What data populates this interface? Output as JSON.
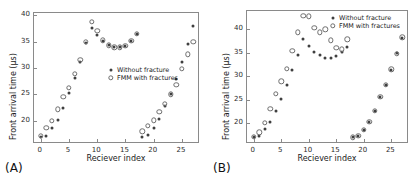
{
  "figure": {
    "background": "#ffffff",
    "marker_closed_color": "#3f3f3f",
    "marker_open_color": "#6d6d6d",
    "axis_color": "#8a8a8a"
  },
  "panels": [
    {
      "label": "(A)",
      "name": "panel-a",
      "chart_data": {
        "type": "scatter",
        "title": "",
        "xlabel": "Reciever index",
        "ylabel": "Front arrival time (μs)",
        "xlim": [
          -1.2,
          28.2
        ],
        "ylim": [
          15.6,
          40.4
        ],
        "xticks": [
          0,
          5,
          10,
          15,
          20,
          25
        ],
        "yticks": [
          20,
          25,
          30,
          35,
          40
        ],
        "grid": false,
        "legend_position": "center",
        "x": [
          0,
          1,
          2,
          3,
          4,
          5,
          6,
          7,
          8,
          9,
          10,
          11,
          12,
          13,
          14,
          15,
          16,
          17,
          18,
          19,
          20,
          21,
          22,
          23,
          24,
          25,
          26,
          27
        ],
        "series": [
          {
            "name": "Without fracture",
            "marker": "closed",
            "values": [
              17.0,
              17.2,
              18.6,
              20.2,
              22.4,
              25.3,
              28.1,
              31.2,
              34.8,
              37.6,
              36.3,
              35.1,
              34.3,
              33.9,
              33.9,
              34.2,
              35.1,
              36.4,
              17.0,
              17.3,
              18.7,
              20.3,
              22.7,
              25.0,
              28.0,
              31.1,
              34.6,
              37.9
            ]
          },
          {
            "name": "FMM with fractures",
            "marker": "open",
            "values": [
              17.1,
              18.7,
              20.0,
              22.2,
              24.5,
              26.2,
              28.9,
              31.5,
              35.0,
              38.7,
              37.0,
              35.2,
              34.3,
              33.9,
              33.9,
              34.2,
              35.1,
              36.5,
              18.0,
              19.0,
              20.1,
              21.7,
              23.2,
              25.0,
              26.8,
              29.8,
              32.6,
              34.9
            ]
          }
        ]
      }
    },
    {
      "label": "(B)",
      "name": "panel-b",
      "chart_data": {
        "type": "scatter",
        "title": "",
        "xlabel": "Reciever index",
        "ylabel": "Front arrival time (μs)",
        "xlim": [
          -1.2,
          28.2
        ],
        "ylim": [
          15.6,
          43.8
        ],
        "xticks": [
          0,
          5,
          10,
          15,
          20,
          25
        ],
        "yticks": [
          20,
          25,
          30,
          35,
          40
        ],
        "grid": false,
        "legend_position": "upper right",
        "x": [
          0,
          1,
          2,
          3,
          4,
          5,
          6,
          7,
          8,
          9,
          10,
          11,
          12,
          13,
          14,
          15,
          16,
          17,
          18,
          19,
          20,
          21,
          22,
          23,
          24,
          25,
          26,
          27
        ],
        "series": [
          {
            "name": "Without fracture",
            "marker": "closed",
            "values": [
              17.0,
              17.3,
              18.7,
              20.3,
              22.6,
              25.2,
              28.1,
              31.2,
              34.4,
              37.8,
              36.3,
              35.1,
              34.4,
              33.9,
              33.9,
              34.3,
              35.2,
              36.2,
              17.0,
              17.3,
              18.6,
              20.3,
              22.6,
              25.5,
              28.2,
              31.3,
              34.8,
              38.0
            ]
          },
          {
            "name": "FMM with fractures",
            "marker": "open",
            "values": [
              17.1,
              18.1,
              20.1,
              23.0,
              26.2,
              28.9,
              31.5,
              35.4,
              39.3,
              42.8,
              42.7,
              40.3,
              39.3,
              39.9,
              37.6,
              36.0,
              35.7,
              37.8,
              17.0,
              17.4,
              18.6,
              20.3,
              22.7,
              25.6,
              28.2,
              31.4,
              34.7,
              38.2
            ]
          }
        ]
      }
    }
  ]
}
